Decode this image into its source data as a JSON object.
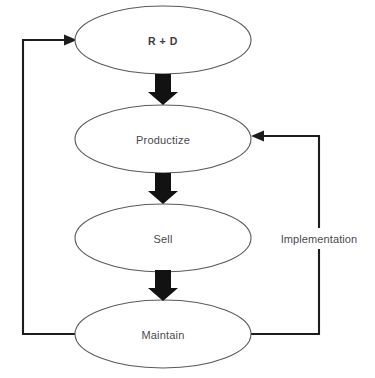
{
  "diagram": {
    "background_color": "#ffffff",
    "node_stroke_color": "#5a5a60",
    "arrow_color": "#121212",
    "loop_color": "#1d1d1d",
    "text_color": "#4a4a4f",
    "nodes": [
      {
        "id": "rd",
        "label": "R + D",
        "cx": 163,
        "cy": 40,
        "rx": 88,
        "ry": 34
      },
      {
        "id": "productize",
        "label": "Productize",
        "cx": 163,
        "cy": 139,
        "rx": 88,
        "ry": 34
      },
      {
        "id": "sell",
        "label": "Sell",
        "cx": 163,
        "cy": 238,
        "rx": 88,
        "ry": 34
      },
      {
        "id": "maintain",
        "label": "Maintain",
        "cx": 163,
        "cy": 334,
        "rx": 88,
        "ry": 34
      }
    ],
    "flow_arrows": [
      {
        "id": "rd-to-productize",
        "from": "rd",
        "to": "productize",
        "direction": "down",
        "cx": 163,
        "y_top": 74,
        "y_bottom": 105
      },
      {
        "id": "productize-to-sell",
        "from": "productize",
        "to": "sell",
        "direction": "down",
        "cx": 163,
        "y_top": 173,
        "y_bottom": 204
      },
      {
        "id": "sell-to-maintain",
        "from": "sell",
        "to": "maintain",
        "direction": "down",
        "cx": 163,
        "y_top": 270,
        "y_bottom": 301
      }
    ],
    "feedback_loops": [
      {
        "id": "maintain-to-rd",
        "label": "",
        "from": "maintain",
        "to": "rd",
        "side": "left",
        "path_points": "76,334 23,334 23,40 70,40"
      },
      {
        "id": "maintain-to-productize",
        "label": "Implementation",
        "from": "maintain",
        "to": "productize",
        "side": "right",
        "path_points": "251,334 319,334 319,136 257,136",
        "label_x": 319,
        "label_y": 238
      }
    ]
  }
}
